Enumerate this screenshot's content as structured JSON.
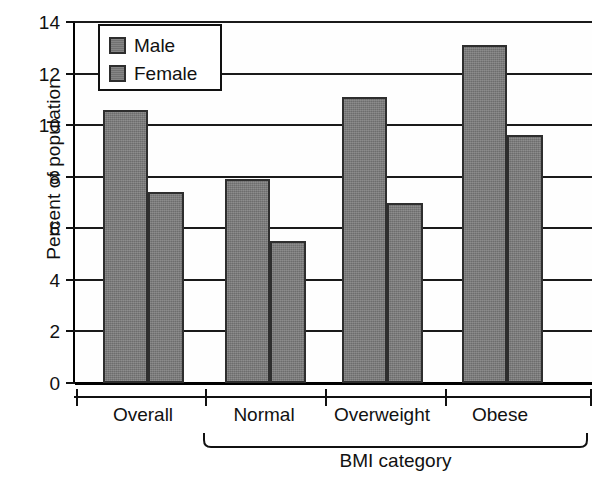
{
  "chart_data": {
    "type": "bar",
    "title": "",
    "xlabel": "BMI category",
    "ylabel": "Percent of population",
    "categories": [
      "Overall",
      "Normal",
      "Overweight",
      "Obese"
    ],
    "series": [
      {
        "name": "Male",
        "values": [
          10.6,
          7.9,
          11.1,
          13.1
        ]
      },
      {
        "name": "Female",
        "values": [
          7.4,
          5.5,
          7.0,
          9.6
        ]
      }
    ],
    "ylim": [
      0,
      14
    ],
    "ytick_labels": [
      "14",
      "12",
      "10",
      "8",
      "6",
      "4",
      "2",
      "0"
    ],
    "ytick_values": [
      14,
      12,
      10,
      8,
      6,
      4,
      2,
      0
    ],
    "grid": true,
    "legend_position": "top-left",
    "legend_entries": [
      "Male",
      "Female"
    ],
    "bracket_label": "BMI category",
    "bracket_categories": [
      "Normal",
      "Overweight",
      "Obese"
    ],
    "colors": {
      "bar_fill": "#787878",
      "bar_edge": "#2e2e2e",
      "axis": "#111111",
      "background": "#ffffff"
    }
  }
}
